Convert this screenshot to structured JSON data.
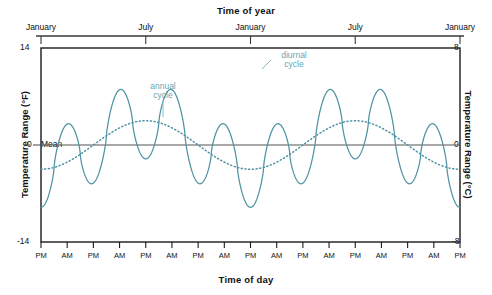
{
  "chart_data": {
    "type": "line",
    "title": "Time of year",
    "xlabel": "Time of day",
    "ylabel": "Temperature Range (°F)",
    "ylabel_right": "Temperature Range (°C)",
    "ylim": [
      -14,
      14
    ],
    "ylim_right": [
      -8,
      8
    ],
    "y_ticks_left": [
      "14",
      "0",
      "-14"
    ],
    "y_ticks_right": [
      "8",
      "0",
      "-8"
    ],
    "grid": false,
    "legend_position": "inline-annotations",
    "top_axis_label": "Time of year",
    "top_axis_ticks": [
      "January",
      "July",
      "January",
      "July",
      "January"
    ],
    "bottom_axis_ticks": [
      "PM",
      "AM",
      "PM",
      "AM",
      "PM",
      "AM",
      "PM",
      "AM",
      "PM",
      "AM",
      "PM",
      "AM",
      "PM",
      "AM",
      "PM",
      "AM",
      "PM"
    ],
    "mean_label": "Mean",
    "annotations": [
      {
        "text_line1": "annual",
        "text_line2": "cycle",
        "target": "annual cycle curve peak near July"
      },
      {
        "text_line1": "diurnal",
        "text_line2": "cycle",
        "target": "diurnal cycle wave peak"
      }
    ],
    "series": [
      {
        "name": "diurnal cycle",
        "style": "solid",
        "color": "#4f93a3",
        "description": "High-frequency daily oscillation, 8 full cycles across 2 years, amplitude about 11 °F peak to trough offset by the annual cycle",
        "amplitude_F": 11,
        "cycles": 8
      },
      {
        "name": "annual cycle",
        "style": "dotted",
        "color": "#4f93a3",
        "description": "Low-frequency seasonal sinusoid, 2 full cycles across 2 years, peaking in July and dipping in January",
        "amplitude_F": 3.5,
        "cycles": 2
      },
      {
        "name": "mean",
        "style": "solid-thin",
        "color": "#555555",
        "value_F": 0
      }
    ],
    "x_domain_years": 2,
    "colors": {
      "series_teal": "#4f93a3",
      "annotation_teal": "#6aa6b2",
      "mean_gray": "#555555",
      "axis_black": "#1a1a1a",
      "background": "#ffffff"
    }
  }
}
